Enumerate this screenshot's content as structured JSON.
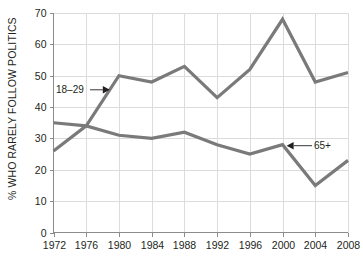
{
  "chart_data": {
    "type": "line",
    "title": "",
    "xlabel": "",
    "ylabel": "% WHO RARELY FOLLOW POLITICS",
    "x": [
      1972,
      1976,
      1980,
      1984,
      1988,
      1992,
      1996,
      2000,
      2004,
      2008
    ],
    "xticklabels": [
      "1972",
      "1976",
      "1980",
      "1984",
      "1988",
      "1992",
      "1996",
      "2000",
      "2004",
      "2008"
    ],
    "yticklabels": [
      "0",
      "10",
      "20",
      "30",
      "40",
      "50",
      "60",
      "70"
    ],
    "yticks": [
      0,
      10,
      20,
      30,
      40,
      50,
      60,
      70
    ],
    "ylim": [
      0,
      70
    ],
    "xlim": [
      1972,
      2008
    ],
    "grid": true,
    "legend_position": "inline-annotations",
    "line_color": "#7a7a7a",
    "grid_color": "#dcdcdc",
    "axis_color": "#8c8c8c",
    "text_color": "#231f20",
    "background": "#ffffff",
    "series": [
      {
        "name": "18–29",
        "values": [
          26,
          34,
          50,
          48,
          53,
          43,
          52,
          68,
          48,
          51
        ]
      },
      {
        "name": "65+",
        "values": [
          35,
          34,
          31,
          30,
          32,
          28,
          25,
          28,
          15,
          23
        ]
      }
    ],
    "annotations": [
      {
        "text": "18–29",
        "series": "18–29",
        "arrow": "right"
      },
      {
        "text": "65+",
        "series": "65+",
        "arrow": "left"
      }
    ]
  }
}
